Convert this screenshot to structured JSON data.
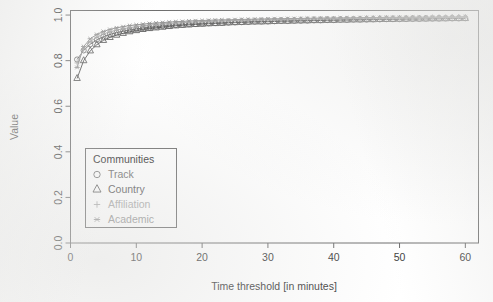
{
  "chart_data": {
    "type": "line",
    "title": "",
    "xlabel": "Time threshold [in minutes]",
    "ylabel": "Value",
    "xlim": [
      0,
      62
    ],
    "ylim": [
      0.0,
      1.02
    ],
    "xticks": [
      "0",
      "10",
      "20",
      "30",
      "40",
      "50",
      "60"
    ],
    "xtick_values": [
      0,
      10,
      20,
      30,
      40,
      50,
      60
    ],
    "yticks": [
      "0.0",
      "0.2",
      "0.4",
      "0.6",
      "0.8",
      "1.0"
    ],
    "ytick_values": [
      0.0,
      0.2,
      0.4,
      0.6,
      0.8,
      1.0
    ],
    "grid": false,
    "legend_position": "center-left",
    "legend_title": "Communities",
    "x": [
      1,
      2,
      3,
      4,
      5,
      6,
      7,
      8,
      9,
      10,
      11,
      12,
      13,
      14,
      15,
      16,
      17,
      18,
      19,
      20,
      21,
      22,
      23,
      24,
      25,
      26,
      27,
      28,
      29,
      30,
      31,
      32,
      33,
      34,
      35,
      36,
      37,
      38,
      39,
      40,
      41,
      42,
      43,
      44,
      45,
      46,
      47,
      48,
      49,
      50,
      51,
      52,
      53,
      54,
      55,
      56,
      57,
      58,
      59,
      60
    ],
    "series": [
      {
        "name": "Track",
        "marker": "circle",
        "color": "#6e6e6e",
        "values": [
          0.805,
          0.845,
          0.872,
          0.891,
          0.905,
          0.915,
          0.923,
          0.929,
          0.934,
          0.939,
          0.943,
          0.946,
          0.949,
          0.952,
          0.954,
          0.956,
          0.958,
          0.96,
          0.961,
          0.963,
          0.964,
          0.965,
          0.966,
          0.967,
          0.968,
          0.969,
          0.97,
          0.971,
          0.972,
          0.972,
          0.973,
          0.974,
          0.974,
          0.975,
          0.975,
          0.976,
          0.977,
          0.977,
          0.978,
          0.978,
          0.979,
          0.979,
          0.98,
          0.98,
          0.98,
          0.981,
          0.981,
          0.982,
          0.982,
          0.982,
          0.983,
          0.983,
          0.983,
          0.984,
          0.984,
          0.984,
          0.985,
          0.985,
          0.985,
          0.986
        ]
      },
      {
        "name": "Country",
        "marker": "triangle",
        "color": "#5a5a5a",
        "values": [
          0.722,
          0.8,
          0.843,
          0.87,
          0.889,
          0.902,
          0.912,
          0.92,
          0.927,
          0.932,
          0.937,
          0.941,
          0.944,
          0.947,
          0.95,
          0.953,
          0.955,
          0.957,
          0.959,
          0.96,
          0.962,
          0.963,
          0.964,
          0.966,
          0.967,
          0.968,
          0.969,
          0.97,
          0.97,
          0.971,
          0.972,
          0.973,
          0.973,
          0.974,
          0.975,
          0.975,
          0.976,
          0.976,
          0.977,
          0.977,
          0.978,
          0.978,
          0.979,
          0.979,
          0.98,
          0.98,
          0.981,
          0.981,
          0.981,
          0.982,
          0.982,
          0.983,
          0.983,
          0.983,
          0.984,
          0.984,
          0.984,
          0.985,
          0.985,
          0.985
        ]
      },
      {
        "name": "Affiliation",
        "marker": "plus",
        "color": "#a8a8a8",
        "values": [
          0.79,
          0.852,
          0.884,
          0.903,
          0.917,
          0.927,
          0.934,
          0.94,
          0.945,
          0.949,
          0.953,
          0.956,
          0.959,
          0.961,
          0.963,
          0.965,
          0.967,
          0.968,
          0.97,
          0.971,
          0.972,
          0.973,
          0.974,
          0.975,
          0.976,
          0.977,
          0.977,
          0.978,
          0.979,
          0.979,
          0.98,
          0.98,
          0.981,
          0.981,
          0.982,
          0.982,
          0.983,
          0.983,
          0.984,
          0.984,
          0.984,
          0.985,
          0.985,
          0.985,
          0.986,
          0.986,
          0.986,
          0.987,
          0.987,
          0.987,
          0.988,
          0.988,
          0.988,
          0.988,
          0.989,
          0.989,
          0.989,
          0.989,
          0.99,
          0.99
        ]
      },
      {
        "name": "Academic",
        "marker": "asterisk",
        "color": "#949494",
        "values": [
          0.77,
          0.862,
          0.896,
          0.915,
          0.928,
          0.937,
          0.944,
          0.949,
          0.954,
          0.957,
          0.96,
          0.963,
          0.965,
          0.967,
          0.969,
          0.971,
          0.972,
          0.974,
          0.975,
          0.976,
          0.977,
          0.978,
          0.979,
          0.979,
          0.98,
          0.981,
          0.981,
          0.982,
          0.983,
          0.983,
          0.984,
          0.984,
          0.985,
          0.985,
          0.985,
          0.986,
          0.986,
          0.987,
          0.987,
          0.987,
          0.988,
          0.988,
          0.988,
          0.989,
          0.989,
          0.989,
          0.989,
          0.99,
          0.99,
          0.99,
          0.99,
          0.991,
          0.991,
          0.991,
          0.991,
          0.992,
          0.992,
          0.992,
          0.992,
          0.993
        ]
      }
    ]
  }
}
